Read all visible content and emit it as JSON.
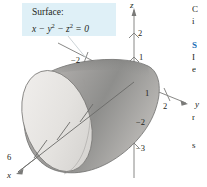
{
  "figure": {
    "callout": {
      "title": "Surface:",
      "equation_plain": "x - y^2 - z^2 = 0",
      "equation_lhs": "x",
      "op1": "−",
      "term2": "y",
      "exp2": "2",
      "op2": "−",
      "term3": "z",
      "exp3": "2",
      "eq": "= 0",
      "box_color": "#dff0f7"
    },
    "axes": {
      "z_label": "z",
      "y_label": "y",
      "x_label": "x",
      "z_ticks": [
        "2",
        "1",
        "−2",
        "−3"
      ],
      "y_ticks": [
        "−2",
        "1",
        "2"
      ],
      "x_ticks": [
        "6"
      ]
    },
    "surface": {
      "name": "paraboloid",
      "cap_color": "#e9e7e5",
      "body_light": "#d8d6d3",
      "body_mid": "#b4b2b0",
      "body_dark": "#8c8c8a",
      "outline_color": "#6f6f6d"
    },
    "axis_color": "#7a7a78"
  },
  "page_text": {
    "lines": [
      {
        "text": "C",
        "top": 4,
        "blue": false
      },
      {
        "text": "i",
        "top": 16,
        "blue": false
      },
      {
        "text": "S",
        "top": 40,
        "blue": true
      },
      {
        "text": "I",
        "top": 52,
        "blue": false
      },
      {
        "text": "e",
        "top": 64,
        "blue": false
      },
      {
        "text": "r",
        "top": 112,
        "blue": false
      },
      {
        "text": "s",
        "top": 140,
        "blue": false
      }
    ]
  }
}
